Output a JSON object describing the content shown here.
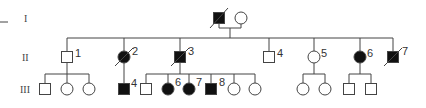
{
  "diagram": {
    "type": "pedigree",
    "colors": {
      "stroke": "#444444",
      "affected": "#111111",
      "unaffected": "#ffffff"
    },
    "generations": [
      {
        "label": "I",
        "y": 18
      },
      {
        "label": "II",
        "y": 57
      },
      {
        "label": "III",
        "y": 89
      }
    ],
    "individuals": [
      {
        "id": "I-1",
        "gen": "I",
        "sex": "male",
        "affected": true,
        "deceased": true,
        "x": 219,
        "label": ""
      },
      {
        "id": "I-2",
        "gen": "I",
        "sex": "female",
        "affected": false,
        "deceased": false,
        "x": 241,
        "label": ""
      },
      {
        "id": "II-1",
        "gen": "II",
        "sex": "male",
        "affected": false,
        "deceased": false,
        "x": 67,
        "label": "1"
      },
      {
        "id": "II-2",
        "gen": "II",
        "sex": "female",
        "affected": true,
        "deceased": true,
        "x": 124,
        "label": "2"
      },
      {
        "id": "II-3",
        "gen": "II",
        "sex": "male",
        "affected": true,
        "deceased": true,
        "x": 180,
        "label": "3"
      },
      {
        "id": "II-4",
        "gen": "II",
        "sex": "male",
        "affected": false,
        "deceased": false,
        "x": 269,
        "label": "4"
      },
      {
        "id": "II-5",
        "gen": "II",
        "sex": "female",
        "affected": false,
        "deceased": false,
        "x": 314,
        "label": "5"
      },
      {
        "id": "II-6",
        "gen": "II",
        "sex": "female",
        "affected": true,
        "deceased": false,
        "x": 360,
        "label": "6"
      },
      {
        "id": "II-7",
        "gen": "II",
        "sex": "male",
        "affected": true,
        "deceased": true,
        "x": 393,
        "label": "7"
      },
      {
        "id": "III-a",
        "gen": "III",
        "sex": "male",
        "affected": false,
        "x": 45,
        "label": ""
      },
      {
        "id": "III-b",
        "gen": "III",
        "sex": "female",
        "affected": false,
        "x": 67,
        "label": ""
      },
      {
        "id": "III-c",
        "gen": "III",
        "sex": "female",
        "affected": false,
        "x": 89,
        "label": ""
      },
      {
        "id": "III-4",
        "gen": "III",
        "sex": "male",
        "affected": true,
        "x": 124,
        "label": "4"
      },
      {
        "id": "III-d",
        "gen": "III",
        "sex": "male",
        "affected": false,
        "x": 146,
        "label": ""
      },
      {
        "id": "III-6",
        "gen": "III",
        "sex": "female",
        "affected": true,
        "x": 168,
        "label": "6"
      },
      {
        "id": "III-7",
        "gen": "III",
        "sex": "female",
        "affected": true,
        "x": 189,
        "label": "7"
      },
      {
        "id": "III-8",
        "gen": "III",
        "sex": "male",
        "affected": true,
        "x": 211,
        "label": "8"
      },
      {
        "id": "III-e",
        "gen": "III",
        "sex": "female",
        "affected": false,
        "x": 234,
        "label": ""
      },
      {
        "id": "III-f",
        "gen": "III",
        "sex": "female",
        "affected": false,
        "x": 255,
        "label": ""
      },
      {
        "id": "III-g",
        "gen": "III",
        "sex": "female",
        "affected": false,
        "x": 303,
        "label": ""
      },
      {
        "id": "III-h",
        "gen": "III",
        "sex": "female",
        "affected": false,
        "x": 325,
        "label": ""
      },
      {
        "id": "III-i",
        "gen": "III",
        "sex": "male",
        "affected": false,
        "x": 349,
        "label": ""
      },
      {
        "id": "III-j",
        "gen": "III",
        "sex": "male",
        "affected": false,
        "x": 371,
        "label": ""
      }
    ]
  }
}
